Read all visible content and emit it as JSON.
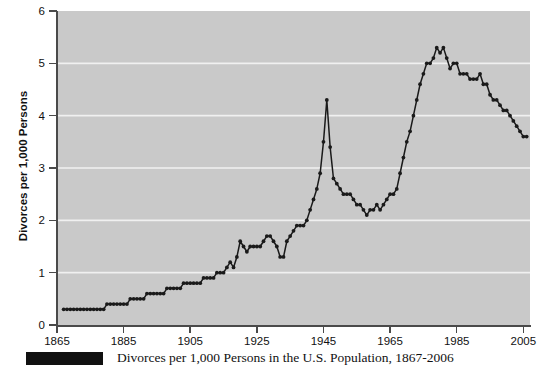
{
  "chart_data": {
    "type": "line",
    "title": "Divorces per 1,000 Persons in the U.S. Population, 1867-2006",
    "xlabel": "",
    "ylabel": "Divorces per 1,000 Persons",
    "xlim": [
      1865,
      2007
    ],
    "ylim": [
      0,
      6
    ],
    "grid": "horizontal",
    "legend": "none",
    "marker": "filled-circle",
    "line_color": "#1a1a1a",
    "plot_background": "#c9c9c9",
    "gridline_color": "#f0f0f0",
    "x_ticks": [
      1865,
      1885,
      1905,
      1925,
      1945,
      1965,
      1985,
      2005
    ],
    "y_ticks": [
      0,
      1,
      2,
      3,
      4,
      5,
      6
    ],
    "x": [
      1867,
      1868,
      1869,
      1870,
      1871,
      1872,
      1873,
      1874,
      1875,
      1876,
      1877,
      1878,
      1879,
      1880,
      1881,
      1882,
      1883,
      1884,
      1885,
      1886,
      1887,
      1888,
      1889,
      1890,
      1891,
      1892,
      1893,
      1894,
      1895,
      1896,
      1897,
      1898,
      1899,
      1900,
      1901,
      1902,
      1903,
      1904,
      1905,
      1906,
      1907,
      1908,
      1909,
      1910,
      1911,
      1912,
      1913,
      1914,
      1915,
      1916,
      1917,
      1918,
      1919,
      1920,
      1921,
      1922,
      1923,
      1924,
      1925,
      1926,
      1927,
      1928,
      1929,
      1930,
      1931,
      1932,
      1933,
      1934,
      1935,
      1936,
      1937,
      1938,
      1939,
      1940,
      1941,
      1942,
      1943,
      1944,
      1945,
      1946,
      1947,
      1948,
      1949,
      1950,
      1951,
      1952,
      1953,
      1954,
      1955,
      1956,
      1957,
      1958,
      1959,
      1960,
      1961,
      1962,
      1963,
      1964,
      1965,
      1966,
      1967,
      1968,
      1969,
      1970,
      1971,
      1972,
      1973,
      1974,
      1975,
      1976,
      1977,
      1978,
      1979,
      1980,
      1981,
      1982,
      1983,
      1984,
      1985,
      1986,
      1987,
      1988,
      1989,
      1990,
      1991,
      1992,
      1993,
      1994,
      1995,
      1996,
      1997,
      1998,
      1999,
      2000,
      2001,
      2002,
      2003,
      2004,
      2005,
      2006
    ],
    "values": [
      0.3,
      0.3,
      0.3,
      0.3,
      0.3,
      0.3,
      0.3,
      0.3,
      0.3,
      0.3,
      0.3,
      0.3,
      0.3,
      0.4,
      0.4,
      0.4,
      0.4,
      0.4,
      0.4,
      0.4,
      0.5,
      0.5,
      0.5,
      0.5,
      0.5,
      0.6,
      0.6,
      0.6,
      0.6,
      0.6,
      0.6,
      0.7,
      0.7,
      0.7,
      0.7,
      0.7,
      0.8,
      0.8,
      0.8,
      0.8,
      0.8,
      0.8,
      0.9,
      0.9,
      0.9,
      0.9,
      1.0,
      1.0,
      1.0,
      1.1,
      1.2,
      1.1,
      1.3,
      1.6,
      1.5,
      1.4,
      1.5,
      1.5,
      1.5,
      1.5,
      1.6,
      1.7,
      1.7,
      1.6,
      1.5,
      1.3,
      1.3,
      1.6,
      1.7,
      1.8,
      1.9,
      1.9,
      1.9,
      2.0,
      2.2,
      2.4,
      2.6,
      2.9,
      3.5,
      4.3,
      3.4,
      2.8,
      2.7,
      2.6,
      2.5,
      2.5,
      2.5,
      2.4,
      2.3,
      2.3,
      2.2,
      2.1,
      2.2,
      2.2,
      2.3,
      2.2,
      2.3,
      2.4,
      2.5,
      2.5,
      2.6,
      2.9,
      3.2,
      3.5,
      3.7,
      4.0,
      4.3,
      4.6,
      4.8,
      5.0,
      5.0,
      5.1,
      5.3,
      5.2,
      5.3,
      5.1,
      4.9,
      5.0,
      5.0,
      4.8,
      4.8,
      4.8,
      4.7,
      4.7,
      4.7,
      4.8,
      4.6,
      4.6,
      4.4,
      4.3,
      4.3,
      4.2,
      4.1,
      4.1,
      4.0,
      3.9,
      3.8,
      3.7,
      3.6,
      3.6
    ]
  },
  "axis": {
    "y_title": "Divorces per 1,000 Persons",
    "y_labels": [
      "6",
      "5",
      "4",
      "3",
      "2",
      "1",
      "0"
    ],
    "x_labels": [
      "1865",
      "1885",
      "1905",
      "1925",
      "1945",
      "1965",
      "1985",
      "2005"
    ]
  },
  "caption": {
    "text": "Divorces per 1,000 Persons in the U.S. Population, 1867-2006",
    "swatch_color": "#111111"
  }
}
